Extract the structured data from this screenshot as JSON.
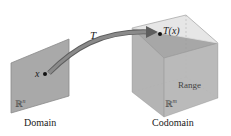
{
  "diagram": {
    "mapping_label": "T",
    "domain": {
      "label": "Domain",
      "space": "ℝ",
      "space_exp": "n",
      "point_label": "x"
    },
    "codomain": {
      "label": "Codomain",
      "space": "ℝ",
      "space_exp": "m",
      "point_label": "T(x)",
      "range_label": "Range"
    },
    "colors": {
      "plane": "#a9a9a9",
      "plane_edge": "#8a8a8a",
      "cube_face": "#cfcfcf",
      "cube_edge": "#9a9a9a",
      "range_plane": "#9b9b9b",
      "arrow": "#7d7d7d",
      "point": "#111111"
    }
  }
}
